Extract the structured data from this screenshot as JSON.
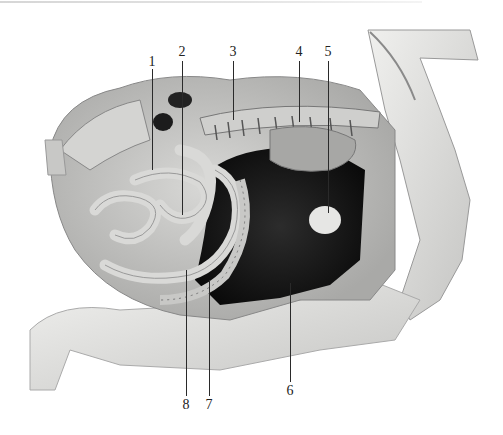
{
  "figure": {
    "colors": {
      "background": "#ffffff",
      "tissue_light": "#e8e8e6",
      "tissue_mid": "#b8b8b6",
      "tissue_dark": "#1a1a1a",
      "label_text": "#222222",
      "leader_line": "#2a2a2a"
    },
    "labels_top": [
      {
        "id": "1",
        "text": "1",
        "x": 152,
        "y": 55,
        "line_to_y": 170
      },
      {
        "id": "2",
        "text": "2",
        "x": 182,
        "y": 45,
        "line_to_y": 215
      },
      {
        "id": "3",
        "text": "3",
        "x": 233,
        "y": 45,
        "line_to_y": 120
      },
      {
        "id": "4",
        "text": "4",
        "x": 299,
        "y": 45,
        "line_to_y": 122
      },
      {
        "id": "5",
        "text": "5",
        "x": 328,
        "y": 45,
        "line_to_y": 213
      }
    ],
    "labels_bottom": [
      {
        "id": "8",
        "text": "8",
        "x": 185,
        "y": 398,
        "line_from_y": 270
      },
      {
        "id": "7",
        "text": "7",
        "x": 209,
        "y": 398,
        "line_from_y": 280
      },
      {
        "id": "6",
        "text": "6",
        "x": 290,
        "y": 384,
        "line_from_y": 283
      }
    ]
  }
}
